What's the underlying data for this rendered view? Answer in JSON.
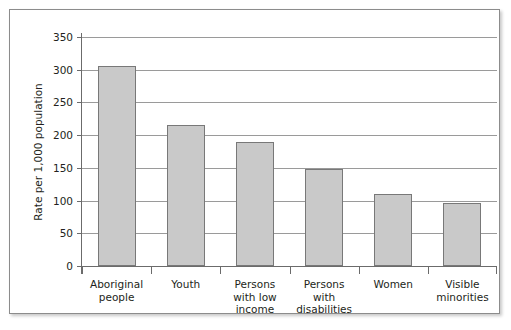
{
  "chart_data": {
    "type": "bar",
    "title": "",
    "subtitle": "",
    "xlabel": "",
    "ylabel": "Rate per 1,000 population",
    "categories": [
      "Aboriginal people",
      "Youth",
      "Persons with low income",
      "Persons with disabilities",
      "Women",
      "Visible minorities"
    ],
    "category_lines": [
      [
        "Aboriginal",
        "people"
      ],
      [
        "Youth"
      ],
      [
        "Persons",
        "with low",
        "income"
      ],
      [
        "Persons",
        "with",
        "disabilities"
      ],
      [
        "Women"
      ],
      [
        "Visible",
        "minorities"
      ]
    ],
    "values": [
      306,
      215,
      190,
      149,
      110,
      97
    ],
    "ylim": [
      0,
      350
    ],
    "ytick_values": [
      0,
      50,
      100,
      150,
      200,
      250,
      300,
      350
    ],
    "ytick_labels": [
      "0",
      "50",
      "100",
      "150",
      "200",
      "250",
      "300",
      "350"
    ],
    "grid": "horizontal",
    "legend": "none",
    "bar_fill_color": "#c9c9c9",
    "bar_border_color": "#787878",
    "gridline_color": "#9a9a9a",
    "axis_color": "#6b6b6b",
    "text_color": "#231f20",
    "frame_color": "#8c8c8c",
    "background_color": "#ffffff"
  }
}
